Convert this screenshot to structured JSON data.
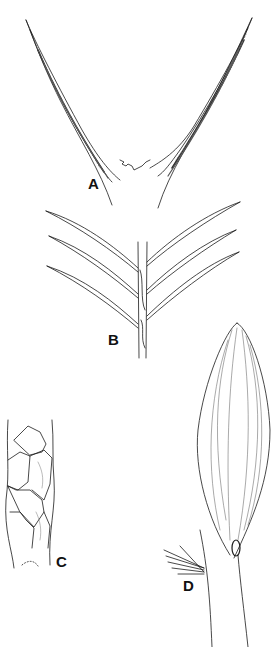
{
  "figure": {
    "type": "botanical-line-drawing",
    "background": "#ffffff",
    "ink_color": "#1a1a1a",
    "panels": [
      {
        "id": "A",
        "label": "A",
        "subject": "pair of spreading leaf tips / awns diverging in a V from a toothed junction"
      },
      {
        "id": "B",
        "label": "B",
        "subject": "stem with three pairs of linear leaves arranged pinnately"
      },
      {
        "id": "C",
        "label": "C",
        "subject": "section of stem covered with overlapping scale-like leaves"
      },
      {
        "id": "D",
        "label": "D",
        "subject": "ovate veined leaf/bract attached to a stem with a small tuft of hairs"
      }
    ]
  }
}
